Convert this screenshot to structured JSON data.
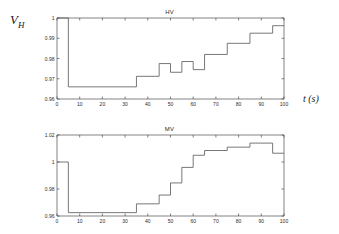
{
  "figure": {
    "panels": [
      {
        "key": "hv",
        "title": "HV",
        "ylabel_main": "V",
        "ylabel_sub": "H",
        "xlabel": "t (s)"
      },
      {
        "key": "mv",
        "title": "MV",
        "ylabel_main": "V",
        "ylabel_sub": "M",
        "xlabel": "t (s)"
      }
    ]
  },
  "chart_data": [
    {
      "type": "line",
      "id": "hv",
      "title": "HV",
      "xlabel": "t (s)",
      "ylabel": "V_H",
      "xlim": [
        0,
        100
      ],
      "ylim": [
        0.96,
        1.0
      ],
      "xticks": [
        0,
        10,
        20,
        30,
        40,
        50,
        60,
        70,
        80,
        90,
        100
      ],
      "xticklabels": [
        "0",
        "10",
        "20",
        "30",
        "40",
        "50",
        "60",
        "70",
        "80",
        "90",
        "100"
      ],
      "yticks": [
        0.96,
        0.97,
        0.98,
        0.99,
        1.0
      ],
      "yticklabels": [
        "0.96",
        "0.97",
        "0.98",
        "0.99",
        "1"
      ],
      "grid": false,
      "legend": null,
      "drawstyle": "steps-post",
      "x": [
        0,
        5,
        35,
        45,
        50,
        55,
        60,
        65,
        75,
        85,
        95,
        100
      ],
      "values": [
        1.0,
        0.966,
        0.9712,
        0.9775,
        0.9732,
        0.9785,
        0.9745,
        0.982,
        0.9875,
        0.9925,
        0.9962,
        0.9962
      ],
      "series": [
        {
          "name": "V_H",
          "x": [
            0,
            5,
            35,
            45,
            50,
            55,
            60,
            65,
            75,
            85,
            95,
            100
          ],
          "values": [
            1.0,
            0.966,
            0.9712,
            0.9775,
            0.9732,
            0.9785,
            0.9745,
            0.982,
            0.9875,
            0.9925,
            0.9962,
            0.9962
          ]
        }
      ]
    },
    {
      "type": "line",
      "id": "mv",
      "title": "MV",
      "xlabel": "t (s)",
      "ylabel": "V_M",
      "xlim": [
        0,
        100
      ],
      "ylim": [
        0.96,
        1.02
      ],
      "xticks": [
        0,
        10,
        20,
        30,
        40,
        50,
        60,
        70,
        80,
        90,
        100
      ],
      "xticklabels": [
        "0",
        "10",
        "20",
        "30",
        "40",
        "50",
        "60",
        "70",
        "80",
        "90",
        "100"
      ],
      "yticks": [
        0.96,
        0.98,
        1.0,
        1.02
      ],
      "yticklabels": [
        "0.96",
        "0.98",
        "1",
        "1.02"
      ],
      "grid": false,
      "legend": null,
      "drawstyle": "steps-post",
      "x": [
        0,
        5,
        35,
        45,
        50,
        55,
        60,
        65,
        75,
        85,
        95,
        100
      ],
      "values": [
        1.0,
        0.9625,
        0.969,
        0.9755,
        0.9845,
        0.996,
        1.005,
        1.0085,
        1.011,
        1.014,
        1.0065,
        1.0065
      ],
      "series": [
        {
          "name": "V_M",
          "x": [
            0,
            5,
            35,
            45,
            50,
            55,
            60,
            65,
            75,
            85,
            95,
            100
          ],
          "values": [
            1.0,
            0.9625,
            0.969,
            0.9755,
            0.9845,
            0.996,
            1.005,
            1.0085,
            1.011,
            1.014,
            1.0065,
            1.0065
          ]
        }
      ]
    }
  ]
}
